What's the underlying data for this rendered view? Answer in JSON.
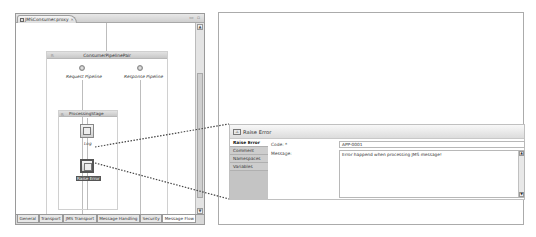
{
  "editor": {
    "tab_title": "JMSConsumer.proxy",
    "tab_close": "✕",
    "window_controls": "▭ ▫",
    "bottom_tabs": [
      {
        "label": "General",
        "active": false
      },
      {
        "label": "Transport",
        "active": false
      },
      {
        "label": "JMS Transport",
        "active": false
      },
      {
        "label": "Message Handling",
        "active": false
      },
      {
        "label": "Security",
        "active": false
      },
      {
        "label": "Message Flow",
        "active": true
      }
    ],
    "scroll_up": "▲",
    "scroll_down": "▼"
  },
  "flow": {
    "pipeline_pair": "ConsumerPipelinePair",
    "request_pipeline": "Request Pipeline",
    "response_pipeline": "Response Pipeline",
    "stage": "ProcessingStage",
    "actions": [
      {
        "label": "Log",
        "selected": false
      },
      {
        "label": "Raise Error",
        "selected": true
      }
    ]
  },
  "properties": {
    "title": "Raise Error",
    "sidebar": [
      {
        "label": "Raise Error",
        "active": true
      },
      {
        "label": "Comment",
        "active": false
      },
      {
        "label": "Namespaces",
        "active": false
      },
      {
        "label": "Variables",
        "active": false
      }
    ],
    "code_label": "Code: *",
    "code_value": "APP-0001",
    "message_label": "Message:",
    "message_value": "Error happend when processing JMS message!",
    "scroll_up": "▲",
    "scroll_down": "▼"
  }
}
